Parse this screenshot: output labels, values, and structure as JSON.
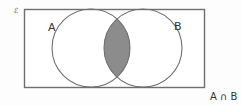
{
  "diagram": {
    "type": "venn",
    "sets": [
      {
        "label": "A"
      },
      {
        "label": "B"
      }
    ],
    "shaded_region": "intersection",
    "caption": "A ∩ B",
    "corner_mark": "ℰ",
    "colors": {
      "outline": "#6f6f6f",
      "shade": "#8c8c8c",
      "background": "#ffffff",
      "text": "#333333"
    }
  }
}
